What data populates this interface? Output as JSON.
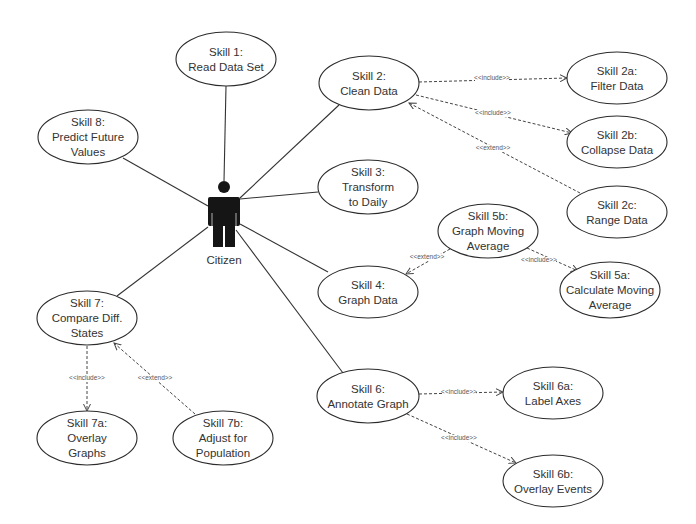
{
  "diagram": {
    "type": "uml-use-case",
    "actor": {
      "id": "citizen",
      "label": "Citizen",
      "x": 224,
      "y": 187
    },
    "use_cases": [
      {
        "id": "s1",
        "lines": [
          "Skill 1:",
          "Read Data Set"
        ],
        "cx": 226,
        "cy": 59,
        "rx": 50,
        "ry": 27
      },
      {
        "id": "s2",
        "lines": [
          "Skill 2:",
          "Clean Data"
        ],
        "cx": 369,
        "cy": 83,
        "rx": 50,
        "ry": 27
      },
      {
        "id": "s2a",
        "lines": [
          "Skill 2a:",
          "Filter Data"
        ],
        "cx": 617,
        "cy": 78,
        "rx": 50,
        "ry": 26
      },
      {
        "id": "s2b",
        "lines": [
          "Skill 2b:",
          "Collapse Data"
        ],
        "cx": 617,
        "cy": 142,
        "rx": 50,
        "ry": 26
      },
      {
        "id": "s2c",
        "lines": [
          "Skill 2c:",
          "Range Data"
        ],
        "cx": 617,
        "cy": 212,
        "rx": 50,
        "ry": 26
      },
      {
        "id": "s3",
        "lines": [
          "Skill 3:",
          "Transform",
          "to Daily"
        ],
        "cx": 368,
        "cy": 187,
        "rx": 50,
        "ry": 27
      },
      {
        "id": "s4",
        "lines": [
          "Skill 4:",
          "Graph Data"
        ],
        "cx": 368,
        "cy": 292,
        "rx": 50,
        "ry": 26
      },
      {
        "id": "s5a",
        "lines": [
          "Skill 5a:",
          "Calculate Moving",
          "Average"
        ],
        "cx": 610,
        "cy": 290,
        "rx": 50,
        "ry": 28
      },
      {
        "id": "s5b",
        "lines": [
          "Skill 5b:",
          "Graph Moving",
          "Average"
        ],
        "cx": 488,
        "cy": 231,
        "rx": 50,
        "ry": 27
      },
      {
        "id": "s6",
        "lines": [
          "Skill 6:",
          "Annotate Graph"
        ],
        "cx": 368,
        "cy": 396,
        "rx": 51,
        "ry": 27
      },
      {
        "id": "s6a",
        "lines": [
          "Skill 6a:",
          "Label Axes"
        ],
        "cx": 553,
        "cy": 393,
        "rx": 50,
        "ry": 26
      },
      {
        "id": "s6b",
        "lines": [
          "Skill 6b:",
          "Overlay Events"
        ],
        "cx": 553,
        "cy": 481,
        "rx": 50,
        "ry": 26
      },
      {
        "id": "s7",
        "lines": [
          "Skill 7:",
          "Compare Diff.",
          "States"
        ],
        "cx": 87,
        "cy": 318,
        "rx": 50,
        "ry": 27
      },
      {
        "id": "s7a",
        "lines": [
          "Skill 7a:",
          "Overlay",
          "Graphs"
        ],
        "cx": 87,
        "cy": 438,
        "rx": 50,
        "ry": 27
      },
      {
        "id": "s7b",
        "lines": [
          "Skill 7b:",
          "Adjust for",
          "Population"
        ],
        "cx": 223,
        "cy": 438,
        "rx": 50,
        "ry": 27
      },
      {
        "id": "s8",
        "lines": [
          "Skill 8:",
          "Predict Future",
          "Values"
        ],
        "cx": 88,
        "cy": 137,
        "rx": 50,
        "ry": 27
      }
    ],
    "associations": [
      {
        "from": "citizen",
        "to": "s1",
        "x1": 224,
        "y1": 181,
        "x2": 226,
        "y2": 86
      },
      {
        "from": "citizen",
        "to": "s2",
        "x1": 240,
        "y1": 198,
        "x2": 339,
        "y2": 105
      },
      {
        "from": "citizen",
        "to": "s3",
        "x1": 240,
        "y1": 199,
        "x2": 318,
        "y2": 192
      },
      {
        "from": "citizen",
        "to": "s4",
        "x1": 240,
        "y1": 224,
        "x2": 328,
        "y2": 272
      },
      {
        "from": "citizen",
        "to": "s6",
        "x1": 236,
        "y1": 230,
        "x2": 343,
        "y2": 373
      },
      {
        "from": "citizen",
        "to": "s7",
        "x1": 208,
        "y1": 227,
        "x2": 117,
        "y2": 296
      },
      {
        "from": "citizen",
        "to": "s8",
        "x1": 208,
        "y1": 206,
        "x2": 123,
        "y2": 158
      }
    ],
    "relationships": [
      {
        "type": "include",
        "label": "<<include>>",
        "from": "s2",
        "to": "s2a",
        "x1": 419,
        "y1": 82,
        "x2": 567,
        "y2": 78,
        "lx": 492,
        "ly": 80,
        "arrow_at": "end"
      },
      {
        "type": "include",
        "label": "<<include>>",
        "from": "s2",
        "to": "s2b",
        "x1": 416,
        "y1": 95,
        "x2": 572,
        "y2": 133,
        "lx": 493,
        "ly": 115,
        "arrow_at": "end"
      },
      {
        "type": "extend",
        "label": "<<extend>>",
        "from": "s2c",
        "to": "s2",
        "x1": 580,
        "y1": 193,
        "x2": 409,
        "y2": 103,
        "lx": 493,
        "ly": 150,
        "arrow_at": "end"
      },
      {
        "type": "extend",
        "label": "<<extend>>",
        "from": "s5b",
        "to": "s4",
        "x1": 450,
        "y1": 249,
        "x2": 406,
        "y2": 274,
        "lx": 427,
        "ly": 259,
        "arrow_at": "end"
      },
      {
        "type": "include",
        "label": "<<include>>",
        "from": "s5b",
        "to": "s5a",
        "x1": 527,
        "y1": 248,
        "x2": 578,
        "y2": 271,
        "lx": 539,
        "ly": 262,
        "arrow_at": "end"
      },
      {
        "type": "include",
        "label": "<<include>>",
        "from": "s6",
        "to": "s6a",
        "x1": 419,
        "y1": 394,
        "x2": 503,
        "y2": 392,
        "lx": 459,
        "ly": 394,
        "arrow_at": "end"
      },
      {
        "type": "include",
        "label": "<<include>>",
        "from": "s6",
        "to": "s6b",
        "x1": 407,
        "y1": 414,
        "x2": 516,
        "y2": 463,
        "lx": 459,
        "ly": 440,
        "arrow_at": "end"
      },
      {
        "type": "include",
        "label": "<<include>>",
        "from": "s7",
        "to": "s7a",
        "x1": 87,
        "y1": 346,
        "x2": 87,
        "y2": 411,
        "lx": 87,
        "ly": 380,
        "arrow_at": "end"
      },
      {
        "type": "extend",
        "label": "<<extend>>",
        "from": "s7b",
        "to": "s7",
        "x1": 195,
        "y1": 414,
        "x2": 114,
        "y2": 343,
        "lx": 155,
        "ly": 380,
        "arrow_at": "end"
      }
    ]
  },
  "colors": {
    "background": "#ffffff",
    "stroke": "#2b2b2b",
    "actor_fill": "#151515",
    "text": "#333333"
  }
}
